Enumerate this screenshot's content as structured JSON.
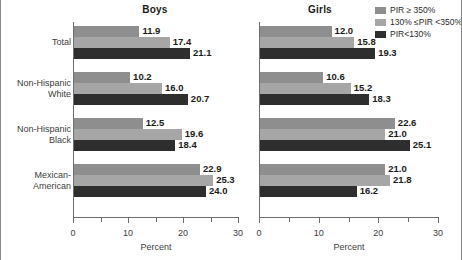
{
  "chart_data": {
    "type": "bar",
    "orientation": "horizontal",
    "title": "",
    "xlabel": "Percent",
    "ylabel": "",
    "xlim": [
      0,
      30
    ],
    "xticks": [
      0,
      10,
      20,
      30
    ],
    "xtick_labels": [
      "0",
      "10",
      "20",
      "30"
    ],
    "minor_xticks": [
      5,
      15,
      25
    ],
    "grid": false,
    "legend_position": "top-right",
    "categories": [
      "Total",
      "Non-Hispanic White",
      "Non-Hispanic Black",
      "Mexican-American"
    ],
    "panels": [
      {
        "name": "Boys",
        "series": [
          {
            "name": "PIR ≥ 350%",
            "values": [
              11.9,
              10.2,
              12.5,
              22.9
            ]
          },
          {
            "name": "130% ≤PIR <350%",
            "values": [
              17.4,
              16.0,
              19.6,
              25.3
            ]
          },
          {
            "name": "PIR<130%",
            "values": [
              21.1,
              20.7,
              18.4,
              24.0
            ]
          }
        ]
      },
      {
        "name": "Girls",
        "series": [
          {
            "name": "PIR ≥ 350%",
            "values": [
              12.0,
              10.6,
              22.6,
              21.0
            ]
          },
          {
            "name": "130% ≤PIR <350%",
            "values": [
              15.8,
              15.2,
              21.0,
              21.8
            ]
          },
          {
            "name": "PIR<130%",
            "values": [
              19.3,
              18.3,
              25.1,
              16.2
            ]
          }
        ]
      }
    ],
    "series_colors": [
      "#8e8e8e",
      "#a6a6a6",
      "#2e2e2e"
    ]
  },
  "panels": {
    "boys": {
      "title": "Boys",
      "axis_title": "Percent",
      "tick_labels": [
        "0",
        "10",
        "20",
        "30"
      ],
      "groups": [
        {
          "category": "Total",
          "bars": [
            {
              "series": "PIR ≥ 350%",
              "value": 11.9,
              "label": "11.9"
            },
            {
              "series": "130% ≤PIR <350%",
              "value": 17.4,
              "label": "17.4"
            },
            {
              "series": "PIR<130%",
              "value": 21.1,
              "label": "21.1"
            }
          ]
        },
        {
          "category": "Non-Hispanic White",
          "bars": [
            {
              "series": "PIR ≥ 350%",
              "value": 10.2,
              "label": "10.2"
            },
            {
              "series": "130% ≤PIR <350%",
              "value": 16.0,
              "label": "16.0"
            },
            {
              "series": "PIR<130%",
              "value": 20.7,
              "label": "20.7"
            }
          ]
        },
        {
          "category": "Non-Hispanic Black",
          "bars": [
            {
              "series": "PIR ≥ 350%",
              "value": 12.5,
              "label": "12.5"
            },
            {
              "series": "130% ≤PIR <350%",
              "value": 19.6,
              "label": "19.6"
            },
            {
              "series": "PIR<130%",
              "value": 18.4,
              "label": "18.4"
            }
          ]
        },
        {
          "category": "Mexican-American",
          "bars": [
            {
              "series": "PIR ≥ 350%",
              "value": 22.9,
              "label": "22.9"
            },
            {
              "series": "130% ≤PIR <350%",
              "value": 25.3,
              "label": "25.3"
            },
            {
              "series": "PIR<130%",
              "value": 24.0,
              "label": "24.0"
            }
          ]
        }
      ]
    },
    "girls": {
      "title": "Girls",
      "axis_title": "Percent",
      "tick_labels": [
        "0",
        "10",
        "20",
        "30"
      ],
      "groups": [
        {
          "category": "Total",
          "bars": [
            {
              "series": "PIR ≥ 350%",
              "value": 12.0,
              "label": "12.0"
            },
            {
              "series": "130% ≤PIR <350%",
              "value": 15.8,
              "label": "15.8"
            },
            {
              "series": "PIR<130%",
              "value": 19.3,
              "label": "19.3"
            }
          ]
        },
        {
          "category": "Non-Hispanic White",
          "bars": [
            {
              "series": "PIR ≥ 350%",
              "value": 10.6,
              "label": "10.6"
            },
            {
              "series": "130% ≤PIR <350%",
              "value": 15.2,
              "label": "15.2"
            },
            {
              "series": "PIR<130%",
              "value": 18.3,
              "label": "18.3"
            }
          ]
        },
        {
          "category": "Non-Hispanic Black",
          "bars": [
            {
              "series": "PIR ≥ 350%",
              "value": 22.6,
              "label": "22.6"
            },
            {
              "series": "130% ≤PIR <350%",
              "value": 21.0,
              "label": "21.0"
            },
            {
              "series": "PIR<130%",
              "value": 25.1,
              "label": "25.1"
            }
          ]
        },
        {
          "category": "Mexican-American",
          "bars": [
            {
              "series": "PIR ≥ 350%",
              "value": 21.0,
              "label": "21.0"
            },
            {
              "series": "130% ≤PIR <350%",
              "value": 21.8,
              "label": "21.8"
            },
            {
              "series": "PIR<130%",
              "value": 16.2,
              "label": "16.2"
            }
          ]
        }
      ]
    }
  },
  "category_labels": [
    {
      "lines": [
        "Total"
      ]
    },
    {
      "lines": [
        "Non-Hispanic",
        "White"
      ]
    },
    {
      "lines": [
        "Non-Hispanic",
        "Black"
      ]
    },
    {
      "lines": [
        "Mexican-",
        "American"
      ]
    }
  ],
  "legend": {
    "items": [
      {
        "label": "PIR ≥ 350%",
        "color": "#8e8e8e"
      },
      {
        "label": "130% ≤PIR <350%",
        "color": "#a6a6a6"
      },
      {
        "label": "PIR<130%",
        "color": "#2e2e2e"
      }
    ]
  }
}
